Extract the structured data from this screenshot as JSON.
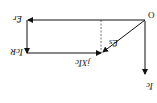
{
  "diagram": {
    "type": "phasor-diagram",
    "orientation": "rotated-180",
    "labels": {
      "origin": "O",
      "current": "Īc",
      "source_emf": "Ēs",
      "reactive_drop": "jXĪc",
      "resistive_drop": "ĪcR",
      "receiving_emf": "Ēr"
    },
    "colors": {
      "line": "#111111",
      "background": "#ffffff"
    }
  }
}
